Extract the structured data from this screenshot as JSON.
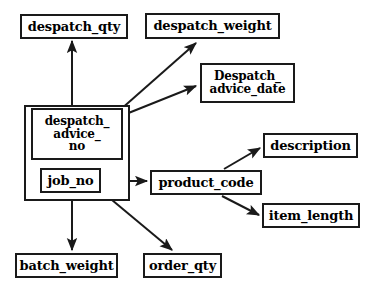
{
  "diagram": {
    "colors": {
      "stroke": "#1a1a1a",
      "fill": "#ffffff",
      "text": "#000000"
    },
    "group": {
      "name": "despatch-advice-group",
      "x": 24,
      "y": 105,
      "w": 106,
      "h": 96
    },
    "nodes": [
      {
        "id": "despatch_qty",
        "label": "despatch_qty",
        "x": 20,
        "y": 14,
        "w": 108,
        "h": 25,
        "font": 13
      },
      {
        "id": "despatch_weight",
        "label": "despatch_weight",
        "x": 145,
        "y": 13,
        "w": 135,
        "h": 26,
        "font": 13
      },
      {
        "id": "despatch_advice_date",
        "label": "Despatch_\nadvice_date",
        "x": 200,
        "y": 63,
        "w": 95,
        "h": 40,
        "font": 12
      },
      {
        "id": "despatch_advice_no",
        "label": "despatch_\nadvice_\nno",
        "x": 31,
        "y": 108,
        "w": 92,
        "h": 52,
        "font": 12,
        "inner": true
      },
      {
        "id": "job_no",
        "label": "job_no",
        "x": 40,
        "y": 168,
        "w": 61,
        "h": 25,
        "font": 13,
        "inner": true
      },
      {
        "id": "product_code",
        "label": "product_code",
        "x": 150,
        "y": 170,
        "w": 112,
        "h": 25,
        "font": 13
      },
      {
        "id": "description",
        "label": "description",
        "x": 263,
        "y": 133,
        "w": 95,
        "h": 25,
        "font": 13
      },
      {
        "id": "item_length",
        "label": "item_length",
        "x": 262,
        "y": 203,
        "w": 98,
        "h": 25,
        "font": 13
      },
      {
        "id": "batch_weight",
        "label": "batch_weight",
        "x": 15,
        "y": 253,
        "w": 103,
        "h": 25,
        "font": 13
      },
      {
        "id": "order_qty",
        "label": "order_qty",
        "x": 143,
        "y": 253,
        "w": 79,
        "h": 25,
        "font": 13
      }
    ],
    "edges": [
      {
        "id": "edge-advice-to-despatch-qty",
        "from": "despatch_advice_no",
        "to": "despatch_qty",
        "x1": 72,
        "y1": 105,
        "x2": 72,
        "y2": 41
      },
      {
        "id": "edge-advice-to-despatch-weight",
        "from": "despatch_advice_no",
        "to": "despatch_weight",
        "x1": 120,
        "y1": 110,
        "x2": 196,
        "y2": 43
      },
      {
        "id": "edge-advice-to-advice-date",
        "from": "despatch_advice_no",
        "to": "despatch_advice_date",
        "x1": 121,
        "y1": 116,
        "x2": 196,
        "y2": 86
      },
      {
        "id": "edge-job-to-product-code",
        "from": "job_no",
        "to": "product_code",
        "x1": 101,
        "y1": 181,
        "x2": 147,
        "y2": 181
      },
      {
        "id": "edge-product-to-description",
        "from": "product_code",
        "to": "description",
        "x1": 224,
        "y1": 169,
        "x2": 260,
        "y2": 148
      },
      {
        "id": "edge-product-to-item-length",
        "from": "product_code",
        "to": "item_length",
        "x1": 222,
        "y1": 196,
        "x2": 259,
        "y2": 215
      },
      {
        "id": "edge-group-to-batch-weight",
        "from": "despatch-advice-group",
        "to": "batch_weight",
        "x1": 72,
        "y1": 190,
        "x2": 72,
        "y2": 250
      },
      {
        "id": "edge-job-to-order-qty",
        "from": "job_no",
        "to": "order_qty",
        "x1": 100,
        "y1": 190,
        "x2": 172,
        "y2": 250
      }
    ]
  }
}
